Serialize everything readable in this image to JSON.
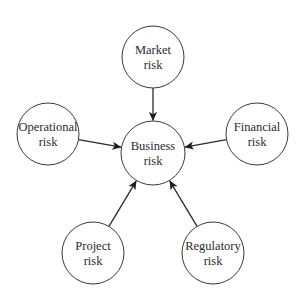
{
  "diagram": {
    "type": "hub-and-spoke",
    "center": {
      "id": "business",
      "lines": [
        "Business",
        "risk"
      ],
      "cx": 153,
      "cy": 153,
      "r": 32
    },
    "nodes": [
      {
        "id": "market",
        "lines": [
          "Market",
          "risk"
        ],
        "cx": 153,
        "cy": 57,
        "r": 31
      },
      {
        "id": "operational",
        "lines": [
          "Operational",
          "risk"
        ],
        "cx": 48,
        "cy": 134,
        "r": 31
      },
      {
        "id": "financial",
        "lines": [
          "Financial",
          "risk"
        ],
        "cx": 257,
        "cy": 134,
        "r": 31
      },
      {
        "id": "project",
        "lines": [
          "Project",
          "risk"
        ],
        "cx": 93,
        "cy": 253,
        "r": 31
      },
      {
        "id": "regulatory",
        "lines": [
          "Regulatory",
          "risk"
        ],
        "cx": 213,
        "cy": 253,
        "r": 31
      }
    ],
    "edges": [
      {
        "from": "market",
        "to": "business"
      },
      {
        "from": "operational",
        "to": "business"
      },
      {
        "from": "financial",
        "to": "business"
      },
      {
        "from": "project",
        "to": "business"
      },
      {
        "from": "regulatory",
        "to": "business"
      }
    ],
    "colors": {
      "stroke": "#3a3a3a",
      "text": "#2b2b2b",
      "background": "#ffffff"
    }
  }
}
